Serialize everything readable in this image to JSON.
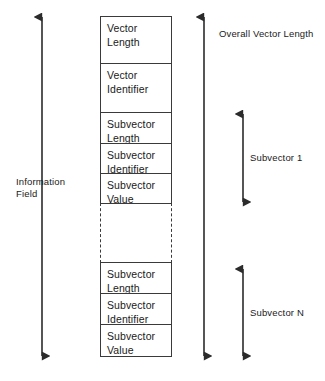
{
  "diagram": {
    "background_color": "#ffffff",
    "line_color": "#3a3a3a",
    "text_color": "#1a1a1a"
  },
  "stack": {
    "cells": [
      {
        "id": "vector-length",
        "line1": "Vector",
        "line2": "Length",
        "style": "solid"
      },
      {
        "id": "vector-identifier",
        "line1": "Vector",
        "line2": "Identifier",
        "style": "solid"
      },
      {
        "id": "subvector-1-length",
        "line1": "Subvector",
        "line2": "Length",
        "style": "solid"
      },
      {
        "id": "subvector-1-identifier",
        "line1": "Subvector",
        "line2": "Identifier",
        "style": "solid"
      },
      {
        "id": "subvector-1-value",
        "line1": "Subvector",
        "line2": "Value",
        "style": "solid"
      },
      {
        "id": "continuation-gap",
        "line1": "",
        "line2": "",
        "style": "dashed"
      },
      {
        "id": "subvector-n-length",
        "line1": "Subvector",
        "line2": "Length",
        "style": "solid"
      },
      {
        "id": "subvector-n-identifier",
        "line1": "Subvector",
        "line2": "Identifier",
        "style": "solid"
      },
      {
        "id": "subvector-n-value",
        "line1": "Subvector",
        "line2": "Value",
        "style": "solid"
      }
    ]
  },
  "annotations": {
    "information_field": {
      "line1": "Information",
      "line2": "Field",
      "arrow": "double-vertical"
    },
    "overall_vector_length": {
      "line1": "Overall Vector Length",
      "line2": "",
      "arrow": "double-vertical"
    },
    "subvector_1": {
      "line1": "Subvector 1",
      "line2": "",
      "arrow": "double-vertical"
    },
    "subvector_n": {
      "line1": "Subvector N",
      "line2": "",
      "arrow": "double-vertical"
    }
  }
}
